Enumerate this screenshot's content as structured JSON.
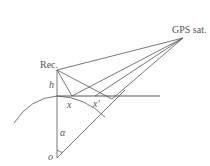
{
  "diagram": {
    "labels": {
      "receiver": "Rec.",
      "satellite": "GPS sat.",
      "height": "h",
      "reflection_point": "x",
      "reflection_point_prime": "x'",
      "angle": "α",
      "origin": "o"
    },
    "colors": {
      "line": "#555555",
      "background": "#ffffff"
    }
  }
}
